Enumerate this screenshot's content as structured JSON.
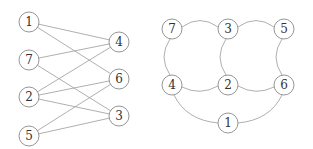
{
  "diagram": {
    "left_graph": {
      "type": "bipartite",
      "left_nodes": [
        "1",
        "7",
        "2",
        "5"
      ],
      "right_nodes": [
        "4",
        "6",
        "3"
      ],
      "edges": [
        [
          "1",
          "4"
        ],
        [
          "1",
          "6"
        ],
        [
          "7",
          "4"
        ],
        [
          "7",
          "3"
        ],
        [
          "2",
          "4"
        ],
        [
          "2",
          "6"
        ],
        [
          "2",
          "3"
        ],
        [
          "5",
          "6"
        ],
        [
          "5",
          "3"
        ]
      ]
    },
    "right_graph": {
      "type": "planar-embedding",
      "nodes": [
        "7",
        "3",
        "5",
        "4",
        "2",
        "6",
        "1"
      ],
      "edges": [
        [
          "7",
          "3"
        ],
        [
          "3",
          "5"
        ],
        [
          "7",
          "4"
        ],
        [
          "3",
          "2"
        ],
        [
          "5",
          "6"
        ],
        [
          "4",
          "2"
        ],
        [
          "2",
          "6"
        ],
        [
          "4",
          "1"
        ],
        [
          "1",
          "6"
        ]
      ]
    }
  },
  "labels": {
    "L1": "1",
    "L7": "7",
    "L2": "2",
    "L5": "5",
    "L4": "4",
    "L6": "6",
    "L3": "3",
    "R7": "7",
    "R3": "3",
    "R5": "5",
    "R4": "4",
    "R2": "2",
    "R6": "6",
    "R1": "1"
  }
}
